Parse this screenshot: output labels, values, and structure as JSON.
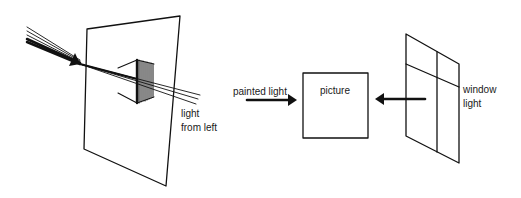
{
  "diagram": {
    "type": "illustration",
    "background": "#ffffff",
    "ink_color": "#111111",
    "panels": [
      {
        "id": "left",
        "description": "Light beam passing through a transparent plane and a prism-like block",
        "labels": {
          "light_line1": "light",
          "light_line2": "from left"
        }
      },
      {
        "id": "center",
        "description": "Picture box receiving painted light from the left",
        "labels": {
          "arrow_label": "painted light",
          "box_label": "picture"
        }
      },
      {
        "id": "right",
        "description": "Window frame emitting light toward the picture",
        "labels": {
          "window_line1": "window",
          "window_line2": "light"
        }
      }
    ]
  }
}
